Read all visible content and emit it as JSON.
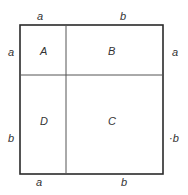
{
  "diagram": {
    "title": "",
    "top_labels": [
      "a",
      "b"
    ],
    "bottom_labels": [
      "a",
      "b"
    ],
    "left_labels": [
      "a",
      "b"
    ],
    "right_labels": [
      "a",
      "·b"
    ],
    "regions": {
      "top_left": "A",
      "top_right": "B",
      "bottom_right": "C",
      "bottom_left": "D"
    }
  }
}
